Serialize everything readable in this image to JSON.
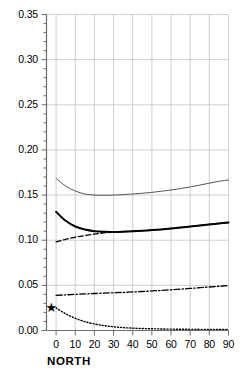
{
  "chart_data": {
    "type": "line",
    "title": "",
    "xlabel": "NORTH",
    "ylabel": "",
    "xlim": [
      -5,
      90
    ],
    "ylim": [
      0.0,
      0.35
    ],
    "grid": true,
    "legend": "none",
    "xticks": [
      "0",
      "10",
      "20",
      "30",
      "40",
      "50",
      "60",
      "70",
      "80",
      "90"
    ],
    "xtick_values": [
      0,
      10,
      20,
      30,
      40,
      50,
      60,
      70,
      80,
      90
    ],
    "yticks": [
      "0.00",
      "0.05",
      "0.10",
      "0.15",
      "0.20",
      "0.25",
      "0.30",
      "0.35"
    ],
    "ytick_values": [
      0.0,
      0.05,
      0.1,
      0.15,
      0.2,
      0.25,
      0.3,
      0.35
    ],
    "x": [
      0,
      5,
      10,
      15,
      20,
      25,
      30,
      35,
      40,
      45,
      50,
      55,
      60,
      65,
      70,
      75,
      80,
      85,
      90
    ],
    "series": [
      {
        "name": "thin-solid-upper",
        "style": "solid-thin",
        "color": "#555555",
        "values": [
          0.1685,
          0.16,
          0.1545,
          0.1512,
          0.15,
          0.1498,
          0.15,
          0.1505,
          0.1512,
          0.152,
          0.153,
          0.1542,
          0.1556,
          0.1572,
          0.159,
          0.161,
          0.1632,
          0.1652,
          0.1668
        ]
      },
      {
        "name": "thick-solid-middle",
        "style": "solid-thick",
        "color": "#000000",
        "values": [
          0.1315,
          0.1215,
          0.1152,
          0.1118,
          0.11,
          0.1093,
          0.1092,
          0.1095,
          0.11,
          0.1105,
          0.1112,
          0.112,
          0.113,
          0.114,
          0.1152,
          0.1163,
          0.1175,
          0.1186,
          0.1195
        ]
      },
      {
        "name": "dashed-middle",
        "style": "dashed",
        "color": "#000000",
        "values": [
          0.0982,
          0.101,
          0.1033,
          0.1052,
          0.1068,
          0.1081,
          0.109,
          0.1096,
          0.1101,
          0.1106,
          0.1112,
          0.112,
          0.113,
          0.114,
          0.1152,
          0.1163,
          0.1175,
          0.1186,
          0.1195
        ]
      },
      {
        "name": "dash-dot-lower",
        "style": "dash-dot",
        "color": "#000000",
        "values": [
          0.039,
          0.0395,
          0.04,
          0.0405,
          0.041,
          0.0414,
          0.0418,
          0.0422,
          0.0427,
          0.0432,
          0.0438,
          0.0444,
          0.0451,
          0.0458,
          0.0466,
          0.0474,
          0.0482,
          0.049,
          0.0497
        ]
      },
      {
        "name": "dotted-decay",
        "style": "dotted",
        "color": "#000000",
        "values": [
          0.025,
          0.0185,
          0.0135,
          0.0098,
          0.0072,
          0.0054,
          0.0041,
          0.0032,
          0.0026,
          0.0022,
          0.0019,
          0.0017,
          0.0015,
          0.0014,
          0.0013,
          0.0013,
          0.0012,
          0.0012,
          0.0012
        ]
      }
    ],
    "annotations": [
      {
        "name": "star-marker",
        "symbol": "★",
        "x": -2.5,
        "y": 0.025,
        "color": "#000000"
      }
    ]
  }
}
